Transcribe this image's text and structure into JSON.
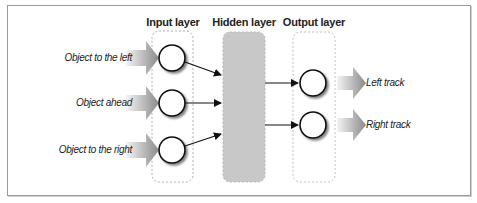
{
  "diagram": {
    "type": "neural-network",
    "layers": [
      {
        "id": "input",
        "label": "Input layer",
        "node_count": 3
      },
      {
        "id": "hidden",
        "label": "Hidden layer",
        "node_count": 0
      },
      {
        "id": "output",
        "label": "Output layer",
        "node_count": 2
      }
    ],
    "inputs": [
      {
        "label": "Object to the left"
      },
      {
        "label": "Object ahead"
      },
      {
        "label": "Object to the right"
      }
    ],
    "outputs": [
      {
        "label": "Left track"
      },
      {
        "label": "Right track"
      }
    ],
    "colors": {
      "hidden_fill": "#c8c8c8",
      "dashed_border": "#b0b0b0",
      "node_stroke": "#111111",
      "arrow_gradient_start": "#f2f2f2",
      "arrow_gradient_end": "#8a8a8a",
      "frame_border": "#9a9a9a"
    }
  }
}
